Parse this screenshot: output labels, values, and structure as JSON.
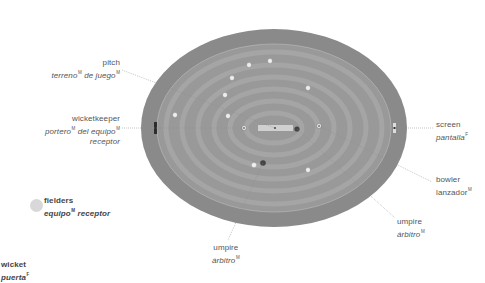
{
  "diagram": {
    "colors": {
      "outfield_outer": "#8a8a8a",
      "outfield_inner": "#999999",
      "stripe_light": "#a3a3a3",
      "pitch": "#d0d0d0",
      "fielder": "#eeeeee",
      "umpire": "#444444",
      "leader_line": "#8c8c8c",
      "legend_dot": "#d8d8d8"
    },
    "field": {
      "cx": 274,
      "cy": 128,
      "rx": 133,
      "ry": 99,
      "inner_rx": 117,
      "inner_ry": 84
    },
    "labels": {
      "pitch": {
        "en": "pitch",
        "es_parts": [
          "terreno",
          "M",
          " de juego",
          "M"
        ]
      },
      "wicketkeeper": {
        "en": "wicketkeeper",
        "es_line1": [
          "portero",
          "M",
          " del equipo",
          "M"
        ],
        "es_line2": "receptor"
      },
      "fielders": {
        "en": "fielders",
        "es_parts": [
          "equipo",
          "M",
          " receptor"
        ]
      },
      "wicket": {
        "en": "wicket",
        "es_parts": [
          "puerta",
          "F"
        ]
      },
      "umpire_bottom": {
        "en": "umpire",
        "es_parts": [
          "árbitro",
          "M"
        ]
      },
      "umpire_right": {
        "en": "umpire",
        "es_parts": [
          "árbitro",
          "M"
        ]
      },
      "bowler": {
        "en": "bowler",
        "es_parts": [
          "lanzador",
          "M"
        ]
      },
      "screen": {
        "en": "screen",
        "es_parts": [
          "pantalla",
          "F"
        ]
      }
    },
    "fielders": [
      {
        "x": 249,
        "y": 65
      },
      {
        "x": 270,
        "y": 61
      },
      {
        "x": 232,
        "y": 78
      },
      {
        "x": 225,
        "y": 95
      },
      {
        "x": 308,
        "y": 88
      },
      {
        "x": 175,
        "y": 115
      },
      {
        "x": 228,
        "y": 116
      },
      {
        "x": 254,
        "y": 165
      },
      {
        "x": 308,
        "y": 170
      }
    ],
    "umpires": [
      {
        "x": 297,
        "y": 129
      },
      {
        "x": 263,
        "y": 163
      }
    ],
    "wicketkeeper": {
      "x": 244,
      "y": 128
    },
    "bowler": {
      "x": 319,
      "y": 126
    }
  }
}
